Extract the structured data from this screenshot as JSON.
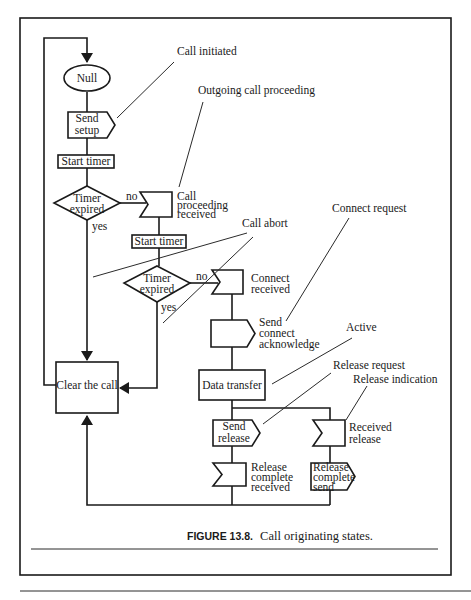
{
  "figure": {
    "caption_label": "FIGURE 13.8.",
    "caption_text": "Call originating states."
  },
  "nodes": {
    "null_state": "Null",
    "send_setup": [
      "Send",
      "setup"
    ],
    "start_timer_1": "Start timer",
    "timer_expired_1": [
      "Timer",
      "expired"
    ],
    "call_proceeding_received": [
      "Call",
      "proceeding",
      "received"
    ],
    "start_timer_2": "Start timer",
    "timer_expired_2": [
      "Timer",
      "expired"
    ],
    "connect_received": [
      "Connect",
      "received"
    ],
    "send_connect_ack": [
      "Send",
      "connect",
      "acknowledge"
    ],
    "data_transfer": "Data transfer",
    "clear_the_call": "Clear the call",
    "send_release": [
      "Send",
      "release"
    ],
    "received_release": [
      "Received",
      "release"
    ],
    "release_complete_received": [
      "Release",
      "complete",
      "received"
    ],
    "release_complete_send": [
      "Release",
      "complete",
      "send"
    ]
  },
  "edge_labels": {
    "no_1": "no",
    "yes_1": "yes",
    "no_2": "no",
    "yes_2": "yes"
  },
  "callouts": {
    "call_initiated": "Call initiated",
    "outgoing_call_proceeding": "Outgoing call proceeding",
    "call_abort": "Call abort",
    "connect_request": "Connect request",
    "active": "Active",
    "release_request": "Release request",
    "release_indication": "Release indication"
  }
}
